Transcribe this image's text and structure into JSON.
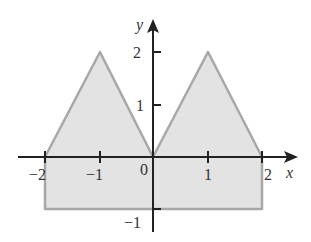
{
  "diagram": {
    "type": "shaded-region-plot",
    "axes": {
      "x_label": "x",
      "y_label": "y",
      "origin_label": "0",
      "x_ticks": [
        {
          "value": -2,
          "label": "−2"
        },
        {
          "value": -1,
          "label": "−1"
        },
        {
          "value": 1,
          "label": "1"
        },
        {
          "value": 2,
          "label": "2"
        }
      ],
      "y_ticks": [
        {
          "value": 2,
          "label": "2"
        },
        {
          "value": 1,
          "label": "1"
        },
        {
          "value": -1,
          "label": "−1"
        }
      ]
    },
    "region": {
      "description": "Shaded region bounded below by y = -1 on [-2, 2] and above by two triangular peaks at (-1, 2) and (1, 2) meeting at the origin",
      "vertices": [
        [
          -2,
          -1
        ],
        [
          -2,
          0
        ],
        [
          -1,
          2
        ],
        [
          0,
          0
        ],
        [
          1,
          2
        ],
        [
          2,
          0
        ],
        [
          2,
          -1
        ]
      ],
      "fill_color": "#e3e3e3",
      "stroke_color": "#a8a8a8"
    },
    "colors": {
      "axis": "#222222",
      "text": "#333333"
    }
  }
}
